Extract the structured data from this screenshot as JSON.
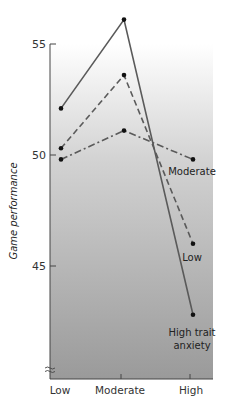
{
  "chart_data": {
    "type": "line",
    "title": "",
    "xlabel": "",
    "ylabel": "Game performance",
    "categories": [
      "Low",
      "Moderate",
      "High"
    ],
    "y_ticks": [
      45,
      50,
      55
    ],
    "ylim": [
      39.5,
      55
    ],
    "axis_break": true,
    "grid": false,
    "legend_position": "inline labels at right end of lines",
    "series": [
      {
        "name": "High trait anxiety",
        "label_lines": [
          "High trait",
          "anxiety"
        ],
        "style": "solid",
        "values": [
          52.1,
          56.1,
          42.8
        ]
      },
      {
        "name": "Low",
        "label_lines": [
          "Low"
        ],
        "style": "dashed",
        "values": [
          50.3,
          53.6,
          46.0
        ]
      },
      {
        "name": "Moderate",
        "label_lines": [
          "Moderate"
        ],
        "style": "dash-dot",
        "values": [
          49.8,
          51.1,
          49.8
        ]
      }
    ]
  },
  "colors": {
    "line": "#5a5a5a",
    "marker": "#111111",
    "axis": "#444444",
    "bg_top": "#ffffff",
    "bg_bottom": "#9a9a9a"
  }
}
